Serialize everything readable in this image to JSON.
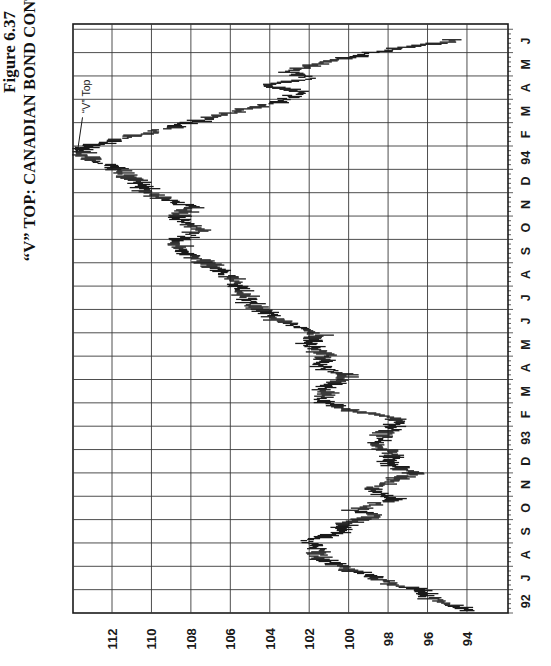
{
  "figure": {
    "label": "Figure 6.37",
    "title": "“V” TOP: CANADIAN BOND CONTINUOUS FUTURES",
    "annotation": "“V” Top"
  },
  "chart_data": {
    "type": "line",
    "style": "bar (high-low ticks), figure rotated 90° counter-clockwise",
    "title": "“V” TOP: CANADIAN BOND CONTINUOUS FUTURES",
    "subtitle": "Figure 6.37",
    "xlabel": "",
    "ylabel": "",
    "time_tick_labels": [
      "92",
      "J",
      "A",
      "S",
      "O",
      "N",
      "D",
      "93",
      "F",
      "M",
      "A",
      "M",
      "J",
      "J",
      "A",
      "S",
      "O",
      "N",
      "D",
      "94",
      "F",
      "M",
      "A",
      "M",
      "J",
      "J"
    ],
    "price_tick_labels": [
      "94",
      "96",
      "98",
      "100",
      "102",
      "104",
      "106",
      "108",
      "110",
      "112"
    ],
    "ylim": [
      92,
      114
    ],
    "grid": true,
    "annotations": [
      {
        "text": "“V” Top",
        "at_month_index": 19.6,
        "price": 113.8
      }
    ],
    "series": [
      {
        "name": "Canadian Bond Continuous Futures",
        "points": [
          {
            "t": 0.1,
            "p": 94.0
          },
          {
            "t": 0.7,
            "p": 96.0
          },
          {
            "t": 1.0,
            "p": 96.5
          },
          {
            "t": 1.2,
            "p": 97.7
          },
          {
            "t": 1.6,
            "p": 98.9
          },
          {
            "t": 2.3,
            "p": 101.5
          },
          {
            "t": 2.8,
            "p": 101.6
          },
          {
            "t": 3.1,
            "p": 102.2
          },
          {
            "t": 3.4,
            "p": 100.7
          },
          {
            "t": 3.8,
            "p": 100.2
          },
          {
            "t": 4.2,
            "p": 98.4
          },
          {
            "t": 4.4,
            "p": 99.7
          },
          {
            "t": 4.9,
            "p": 97.7
          },
          {
            "t": 5.3,
            "p": 99.0
          },
          {
            "t": 5.7,
            "p": 97.6
          },
          {
            "t": 6.0,
            "p": 96.7
          },
          {
            "t": 6.4,
            "p": 98.0
          },
          {
            "t": 6.8,
            "p": 97.7
          },
          {
            "t": 7.2,
            "p": 98.7
          },
          {
            "t": 7.9,
            "p": 97.8
          },
          {
            "t": 8.3,
            "p": 97.6
          },
          {
            "t": 8.7,
            "p": 100.0
          },
          {
            "t": 9.1,
            "p": 101.5
          },
          {
            "t": 9.7,
            "p": 101.0
          },
          {
            "t": 10.2,
            "p": 100.2
          },
          {
            "t": 10.6,
            "p": 101.7
          },
          {
            "t": 11.0,
            "p": 101.0
          },
          {
            "t": 11.5,
            "p": 102.0
          },
          {
            "t": 11.9,
            "p": 101.5
          },
          {
            "t": 12.5,
            "p": 103.5
          },
          {
            "t": 13.2,
            "p": 104.8
          },
          {
            "t": 13.8,
            "p": 105.5
          },
          {
            "t": 14.4,
            "p": 106.0
          },
          {
            "t": 14.9,
            "p": 107.0
          },
          {
            "t": 15.3,
            "p": 108.0
          },
          {
            "t": 15.9,
            "p": 108.8
          },
          {
            "t": 16.4,
            "p": 107.5
          },
          {
            "t": 16.9,
            "p": 108.8
          },
          {
            "t": 17.4,
            "p": 108.0
          },
          {
            "t": 17.9,
            "p": 110.0
          },
          {
            "t": 18.4,
            "p": 110.6
          },
          {
            "t": 18.8,
            "p": 111.3
          },
          {
            "t": 19.3,
            "p": 112.6
          },
          {
            "t": 19.8,
            "p": 113.8
          },
          {
            "t": 20.2,
            "p": 112.1
          },
          {
            "t": 20.6,
            "p": 110.0
          },
          {
            "t": 21.1,
            "p": 107.5
          },
          {
            "t": 21.5,
            "p": 105.5
          },
          {
            "t": 21.9,
            "p": 103.5
          },
          {
            "t": 22.3,
            "p": 102.5
          },
          {
            "t": 22.6,
            "p": 104.0
          },
          {
            "t": 22.9,
            "p": 102.0
          },
          {
            "t": 23.2,
            "p": 103.0
          },
          {
            "t": 23.6,
            "p": 101.0
          },
          {
            "t": 24.1,
            "p": 98.2
          },
          {
            "t": 24.4,
            "p": 95.4
          },
          {
            "t": 24.6,
            "p": 94.4
          }
        ]
      }
    ]
  },
  "layout": {
    "colors": {
      "ink": "#1a1a1a",
      "grid": "#3a3a3a",
      "background": "#ffffff"
    }
  }
}
